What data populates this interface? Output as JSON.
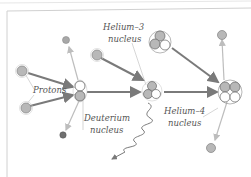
{
  "diagram": {
    "labels": {
      "protons": "Protons",
      "deuterium_line1": "Deuterium",
      "deuterium_line2": "nucleus",
      "helium3_line1": "Helium–3",
      "helium3_line2": "nucleus",
      "helium4_line1": "Helium–4",
      "helium4_line2": "nucleus"
    },
    "colors": {
      "proton": "#b8b8b8",
      "neutron": "#ffffff",
      "arrow_main": "#7a7a7a",
      "arrow_light": "#bdbdbd",
      "positron": "#707070",
      "border": "#cfcfcf",
      "text": "#555555"
    },
    "nodes": [
      {
        "id": "proton-1",
        "type": "proton"
      },
      {
        "id": "proton-2",
        "type": "proton"
      },
      {
        "id": "deuterium",
        "type": "nucleus"
      },
      {
        "id": "positron",
        "type": "particle"
      },
      {
        "id": "neutrino",
        "type": "particle"
      },
      {
        "id": "proton-3",
        "type": "proton"
      },
      {
        "id": "helium-3",
        "type": "nucleus"
      },
      {
        "id": "gamma-ray",
        "type": "photon"
      },
      {
        "id": "helium-3-b",
        "type": "nucleus"
      },
      {
        "id": "helium-4",
        "type": "nucleus"
      },
      {
        "id": "released-proton-1",
        "type": "proton"
      },
      {
        "id": "released-proton-2",
        "type": "proton"
      }
    ]
  }
}
